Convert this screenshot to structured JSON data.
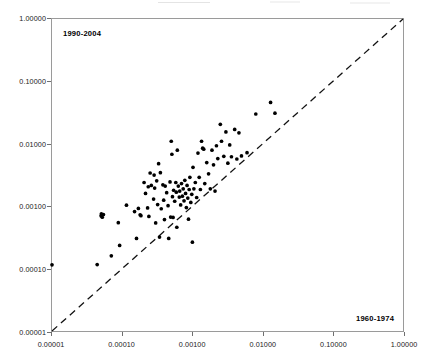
{
  "chart_data": {
    "type": "scatter",
    "title": "",
    "xlabel": "1960-1974",
    "ylabel": "1990-2004",
    "xscale": "log",
    "yscale": "log",
    "xlim": [
      1e-05,
      1.0
    ],
    "ylim": [
      1e-05,
      1.0
    ],
    "grid": false,
    "legend": "none",
    "xticks": [
      "0.00001",
      "0.00010",
      "0.00100",
      "0.01000",
      "0.10000",
      "1.00000"
    ],
    "yticks": [
      "0.00001",
      "0.00010",
      "0.00100",
      "0.01000",
      "0.10000",
      "1.00000"
    ],
    "xtick_values": [
      1e-05,
      0.0001,
      0.001,
      0.01,
      0.1,
      1.0
    ],
    "ytick_values": [
      1e-05,
      0.0001,
      0.001,
      0.01,
      0.1,
      1.0
    ],
    "annotations": [
      {
        "text": "1990-2004",
        "position": "top-left-inside"
      },
      {
        "text": "1960-1974",
        "position": "bottom-right-inside"
      }
    ],
    "reference_line": {
      "style": "dashed",
      "from": [
        1e-05,
        1e-05
      ],
      "to": [
        1.0,
        1.0
      ],
      "description": "1:1 identity line"
    },
    "series": [
      {
        "name": "observations",
        "marker": "filled-circle",
        "color": "#000000",
        "points": [
          [
            1e-05,
            0.000115
          ],
          [
            4.4e-05,
            0.000116
          ],
          [
            5e-05,
            0.0007
          ],
          [
            5.05e-05,
            0.000755
          ],
          [
            5.2e-05,
            0.000665
          ],
          [
            5.4e-05,
            0.000735
          ],
          [
            7e-05,
            0.00016
          ],
          [
            8.8e-05,
            0.000545
          ],
          [
            9.2e-05,
            0.000235
          ],
          [
            0.000115,
            0.00104
          ],
          [
            0.00015,
            0.00082
          ],
          [
            0.00016,
            0.000305
          ],
          [
            0.00017,
            0.00092
          ],
          [
            0.00018,
            0.00073
          ],
          [
            0.000185,
            0.000705
          ],
          [
            0.000205,
            0.0024
          ],
          [
            0.000215,
            0.0016
          ],
          [
            0.00023,
            0.00094
          ],
          [
            0.000235,
            0.00205
          ],
          [
            0.00024,
            0.000685
          ],
          [
            0.00025,
            0.0034
          ],
          [
            0.00026,
            0.00215
          ],
          [
            0.00028,
            0.0013
          ],
          [
            0.000285,
            0.00315
          ],
          [
            0.00029,
            0.00195
          ],
          [
            0.0003,
            0.00054
          ],
          [
            0.00031,
            0.00255
          ],
          [
            0.00032,
            0.00106
          ],
          [
            0.00033,
            0.0048
          ],
          [
            0.00034,
            0.00032
          ],
          [
            0.00035,
            0.00345
          ],
          [
            0.00036,
            0.00091
          ],
          [
            0.00038,
            0.0022
          ],
          [
            0.00039,
            0.00125
          ],
          [
            0.0004,
            0.00061
          ],
          [
            0.00041,
            0.0021
          ],
          [
            0.00043,
            0.00165
          ],
          [
            0.00045,
            0.00102
          ],
          [
            0.00046,
            0.000305
          ],
          [
            0.00048,
            0.00245
          ],
          [
            0.00049,
            0.00067
          ],
          [
            0.0005,
            0.011
          ],
          [
            0.00051,
            0.0068
          ],
          [
            0.00052,
            0.00142
          ],
          [
            0.00053,
            0.00066
          ],
          [
            0.00054,
            0.0018
          ],
          [
            0.00056,
            0.0012
          ],
          [
            0.00058,
            0.0024
          ],
          [
            0.00059,
            0.00168
          ],
          [
            0.0006,
            0.00046
          ],
          [
            0.00061,
            0.0079
          ],
          [
            0.00063,
            0.0021
          ],
          [
            0.00065,
            0.0014
          ],
          [
            0.00066,
            0.00175
          ],
          [
            0.00068,
            0.00105
          ],
          [
            0.0007,
            0.0023
          ],
          [
            0.00072,
            0.00145
          ],
          [
            0.00074,
            0.0019
          ],
          [
            0.00076,
            0.00122
          ],
          [
            0.00078,
            0.0026
          ],
          [
            0.0008,
            0.0016
          ],
          [
            0.00082,
            0.00095
          ],
          [
            0.00084,
            0.00215
          ],
          [
            0.00086,
            0.00135
          ],
          [
            0.00088,
            0.00062
          ],
          [
            0.0009,
            0.00185
          ],
          [
            0.00092,
            0.0029
          ],
          [
            0.00095,
            0.00115
          ],
          [
            0.00098,
            0.00155
          ],
          [
            0.001,
            0.000265
          ],
          [
            0.00102,
            0.0042
          ],
          [
            0.00105,
            0.0019
          ],
          [
            0.0011,
            0.0024
          ],
          [
            0.00115,
            0.00138
          ],
          [
            0.0012,
            0.0071
          ],
          [
            0.00125,
            0.0029
          ],
          [
            0.0013,
            0.00185
          ],
          [
            0.00135,
            0.011
          ],
          [
            0.0014,
            0.0085
          ],
          [
            0.00145,
            0.0082
          ],
          [
            0.0015,
            0.0023
          ],
          [
            0.0016,
            0.005
          ],
          [
            0.0017,
            0.0033
          ],
          [
            0.0018,
            0.0019
          ],
          [
            0.0019,
            0.0079
          ],
          [
            0.002,
            0.0046
          ],
          [
            0.0021,
            0.00175
          ],
          [
            0.0022,
            0.0093
          ],
          [
            0.0023,
            0.0058
          ],
          [
            0.0025,
            0.0205
          ],
          [
            0.0026,
            0.011
          ],
          [
            0.0028,
            0.0063
          ],
          [
            0.003,
            0.0155
          ],
          [
            0.0032,
            0.0049
          ],
          [
            0.0034,
            0.0096
          ],
          [
            0.0036,
            0.0062
          ],
          [
            0.004,
            0.017
          ],
          [
            0.0043,
            0.0057
          ],
          [
            0.0046,
            0.015
          ],
          [
            0.005,
            0.0064
          ],
          [
            0.006,
            0.0072
          ],
          [
            0.008,
            0.03
          ],
          [
            0.013,
            0.046
          ],
          [
            0.015,
            0.031
          ]
        ]
      }
    ]
  }
}
